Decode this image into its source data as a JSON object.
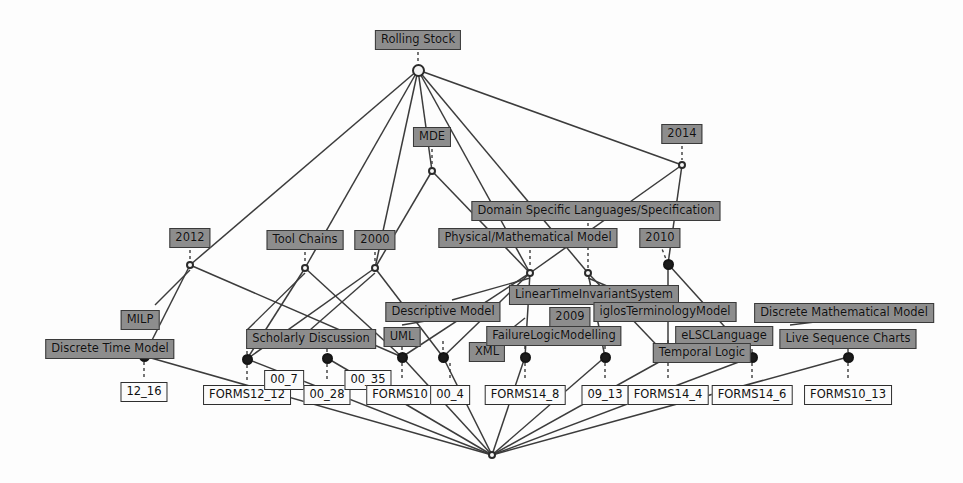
{
  "diagram": {
    "type": "concept-lattice",
    "width": 963,
    "height": 483,
    "colors": {
      "attribute_box_fill": "#8d8d8d",
      "object_box_fill": "#fbfbfb",
      "box_border": "#3a3a3a",
      "edge": "#3c3c3c",
      "node_filled": "#1c1c1c",
      "node_empty": "#f4f4f4",
      "background": "#fdfdfd"
    }
  },
  "nodes": [
    {
      "id": "top",
      "x": 418,
      "y": 70,
      "kind": "empty"
    },
    {
      "id": "n_mde",
      "x": 432,
      "y": 171,
      "kind": "small"
    },
    {
      "id": "n_2014",
      "x": 682,
      "y": 165,
      "kind": "small"
    },
    {
      "id": "n_2012",
      "x": 190,
      "y": 265,
      "kind": "small"
    },
    {
      "id": "n_tool",
      "x": 305,
      "y": 268,
      "kind": "small"
    },
    {
      "id": "n_2000",
      "x": 375,
      "y": 268,
      "kind": "small"
    },
    {
      "id": "n_lti1",
      "x": 530,
      "y": 273,
      "kind": "small"
    },
    {
      "id": "n_lti2",
      "x": 588,
      "y": 273,
      "kind": "small"
    },
    {
      "id": "n_f101",
      "x": 668,
      "y": 264,
      "kind": "filled"
    },
    {
      "id": "n_b1",
      "x": 144,
      "y": 356,
      "kind": "filled"
    },
    {
      "id": "n_b2",
      "x": 247,
      "y": 359,
      "kind": "filled"
    },
    {
      "id": "n_b3",
      "x": 327,
      "y": 358,
      "kind": "filled"
    },
    {
      "id": "n_b4",
      "x": 402,
      "y": 357,
      "kind": "filled"
    },
    {
      "id": "n_b5",
      "x": 443,
      "y": 357,
      "kind": "filled"
    },
    {
      "id": "n_b6",
      "x": 525,
      "y": 357,
      "kind": "filled"
    },
    {
      "id": "n_b7",
      "x": 605,
      "y": 357,
      "kind": "filled"
    },
    {
      "id": "n_b8",
      "x": 668,
      "y": 357,
      "kind": "filled"
    },
    {
      "id": "n_b9",
      "x": 752,
      "y": 357,
      "kind": "filled"
    },
    {
      "id": "n_b10",
      "x": 848,
      "y": 357,
      "kind": "filled"
    },
    {
      "id": "bottom",
      "x": 492,
      "y": 455,
      "kind": "small"
    }
  ],
  "edges": [
    [
      "top",
      "n_mde"
    ],
    [
      "top",
      "n_2012"
    ],
    [
      "top",
      "n_tool"
    ],
    [
      "top",
      "n_2000"
    ],
    [
      "top",
      "n_lti1"
    ],
    [
      "top",
      "n_2014"
    ],
    [
      "top",
      "n_lti2"
    ],
    [
      "n_mde",
      "n_2000"
    ],
    [
      "n_mde",
      "n_lti1"
    ],
    [
      "n_2014",
      "n_lti1"
    ],
    [
      "n_2014",
      "n_f101"
    ],
    [
      "n_2012",
      "n_b1"
    ],
    [
      "n_2012",
      "n_b4"
    ],
    [
      "n_tool",
      "n_b2"
    ],
    [
      "n_tool",
      "n_b4"
    ],
    [
      "n_2000",
      "n_b2"
    ],
    [
      "n_2000",
      "n_b5"
    ],
    [
      "n_lti1",
      "n_b4"
    ],
    [
      "n_lti1",
      "n_b5"
    ],
    [
      "n_lti1",
      "n_b6"
    ],
    [
      "n_lti2",
      "n_b7"
    ],
    [
      "n_lti2",
      "n_b8"
    ],
    [
      "n_f101",
      "n_b8"
    ],
    [
      "n_f101",
      "n_b9"
    ],
    [
      "n_b1",
      "bottom"
    ],
    [
      "n_b2",
      "bottom"
    ],
    [
      "n_b3",
      "bottom"
    ],
    [
      "n_b4",
      "bottom"
    ],
    [
      "n_b5",
      "bottom"
    ],
    [
      "n_b6",
      "bottom"
    ],
    [
      "n_b7",
      "bottom"
    ],
    [
      "n_b8",
      "bottom"
    ],
    [
      "n_b9",
      "bottom"
    ],
    [
      "n_b10",
      "bottom"
    ]
  ],
  "attribute_labels": [
    {
      "name": "rolling-stock",
      "text": "Rolling Stock",
      "x": 418,
      "y": 30,
      "node": "top"
    },
    {
      "name": "mde",
      "text": "MDE",
      "x": 432,
      "y": 127,
      "node": "n_mde"
    },
    {
      "name": "year-2014",
      "text": "2014",
      "x": 682,
      "y": 124,
      "node": "n_2014"
    },
    {
      "name": "dsl-spec",
      "text": "Domain Specific Languages/Specification",
      "x": 596,
      "y": 201,
      "node": "n_lti1"
    },
    {
      "name": "year-2012",
      "text": "2012",
      "x": 190,
      "y": 228,
      "node": "n_2012"
    },
    {
      "name": "tool-chains",
      "text": "Tool Chains",
      "x": 305,
      "y": 230,
      "node": "n_tool"
    },
    {
      "name": "year-2000",
      "text": "2000",
      "x": 375,
      "y": 230,
      "node": "n_2000"
    },
    {
      "name": "phys-math-model",
      "text": "Physical/Mathematical Model",
      "x": 528,
      "y": 228,
      "node": "n_lti1"
    },
    {
      "name": "year-2010",
      "text": "2010",
      "x": 660,
      "y": 228,
      "node": "n_f101"
    },
    {
      "name": "lti-system",
      "text": "LinearTimeInvariantSystem",
      "x": 594,
      "y": 285,
      "node": "n_lti2"
    },
    {
      "name": "year-2009",
      "text": "2009",
      "x": 570,
      "y": 307,
      "node": "n_lti2"
    },
    {
      "name": "iglos-term",
      "text": "iglosTerminologyModel",
      "x": 665,
      "y": 302,
      "node": "n_b8"
    },
    {
      "name": "milp",
      "text": "MILP",
      "x": 140,
      "y": 310,
      "node": "n_b1"
    },
    {
      "name": "discrete-time",
      "text": "Discrete Time Model",
      "x": 110,
      "y": 339,
      "node": "n_b1"
    },
    {
      "name": "scholarly",
      "text": "Scholarly Discussion",
      "x": 311,
      "y": 329,
      "node": "n_b3"
    },
    {
      "name": "descriptive",
      "text": "Descriptive Model",
      "x": 443,
      "y": 302,
      "node": "n_b5"
    },
    {
      "name": "uml",
      "text": "UML",
      "x": 402,
      "y": 327,
      "node": "n_b4"
    },
    {
      "name": "xml",
      "text": "XML",
      "x": 487,
      "y": 342,
      "node": "n_b5"
    },
    {
      "name": "failure-logic",
      "text": "FailureLogicModelling",
      "x": 554,
      "y": 326,
      "node": "n_b6"
    },
    {
      "name": "acsl-frama-c",
      "text": "ACSL(Frama-C)",
      "x": 845,
      "y": 303,
      "node": "n_b10"
    },
    {
      "name": "discrete-math",
      "text": "Discrete Mathematical Model",
      "x": 844,
      "y": 303,
      "node": "n_b10"
    },
    {
      "name": "elsc-language",
      "text": "eLSCLanguage",
      "x": 724,
      "y": 326,
      "node": "n_b9"
    },
    {
      "name": "temporal-logic",
      "text": "Temporal Logic",
      "x": 702,
      "y": 343,
      "node": "n_b8"
    },
    {
      "name": "live-seq-charts",
      "text": "Live Sequence Charts",
      "x": 848,
      "y": 329,
      "node": "n_b10"
    }
  ],
  "object_labels": [
    {
      "name": "obj-12-16",
      "text": "12_16",
      "x": 144,
      "y": 382,
      "node": "n_b1"
    },
    {
      "name": "obj-forms12-12",
      "text": "FORMS12_12",
      "x": 247,
      "y": 385,
      "node": "n_b2"
    },
    {
      "name": "obj-00-7",
      "text": "00_7",
      "x": 284,
      "y": 370,
      "node": "n_b2"
    },
    {
      "name": "obj-00-28",
      "text": "00_28",
      "x": 327,
      "y": 385,
      "node": "n_b3"
    },
    {
      "name": "obj-00-35",
      "text": "00_35",
      "x": 368,
      "y": 370,
      "node": "n_b3"
    },
    {
      "name": "obj-forms10",
      "text": "FORMS10",
      "x": 400,
      "y": 385,
      "node": "n_b4"
    },
    {
      "name": "obj-00-4",
      "text": "00_4",
      "x": 450,
      "y": 385,
      "node": "n_b5"
    },
    {
      "name": "obj-forms14-8",
      "text": "FORMS14_8",
      "x": 525,
      "y": 385,
      "node": "n_b6"
    },
    {
      "name": "obj-09-13",
      "text": "09_13",
      "x": 605,
      "y": 385,
      "node": "n_b7"
    },
    {
      "name": "obj-forms14-4",
      "text": "FORMS14_4",
      "x": 668,
      "y": 385,
      "node": "n_b8"
    },
    {
      "name": "obj-forms14-6",
      "text": "FORMS14_6",
      "x": 752,
      "y": 385,
      "node": "n_b9"
    },
    {
      "name": "obj-forms10-13",
      "text": "FORMS10_13",
      "x": 848,
      "y": 385,
      "node": "n_b10"
    }
  ],
  "label_connectors": [
    {
      "from_x": 418,
      "from_y": 46,
      "to_x": 418,
      "to_y": 64
    },
    {
      "from_x": 432,
      "from_y": 143,
      "to_x": 432,
      "to_y": 166
    },
    {
      "from_x": 682,
      "from_y": 140,
      "to_x": 682,
      "to_y": 160
    },
    {
      "from_x": 190,
      "from_y": 244,
      "to_x": 190,
      "to_y": 260
    },
    {
      "from_x": 305,
      "from_y": 246,
      "to_x": 305,
      "to_y": 263
    },
    {
      "from_x": 375,
      "from_y": 246,
      "to_x": 375,
      "to_y": 263
    },
    {
      "from_x": 530,
      "from_y": 244,
      "to_x": 530,
      "to_y": 268
    },
    {
      "from_x": 588,
      "from_y": 217,
      "to_x": 588,
      "to_y": 268
    },
    {
      "from_x": 660,
      "from_y": 244,
      "to_x": 666,
      "to_y": 259
    },
    {
      "from_x": 144,
      "from_y": 352,
      "to_x": 144,
      "to_y": 352
    },
    {
      "from_x": 144,
      "from_y": 362,
      "to_x": 144,
      "to_y": 377
    },
    {
      "from_x": 247,
      "from_y": 345,
      "to_x": 247,
      "to_y": 354
    },
    {
      "from_x": 247,
      "from_y": 365,
      "to_x": 247,
      "to_y": 380
    },
    {
      "from_x": 327,
      "from_y": 343,
      "to_x": 327,
      "to_y": 353
    },
    {
      "from_x": 327,
      "from_y": 364,
      "to_x": 327,
      "to_y": 380
    },
    {
      "from_x": 402,
      "from_y": 341,
      "to_x": 402,
      "to_y": 352
    },
    {
      "from_x": 402,
      "from_y": 363,
      "to_x": 402,
      "to_y": 380
    },
    {
      "from_x": 443,
      "from_y": 341,
      "to_x": 443,
      "to_y": 352
    },
    {
      "from_x": 450,
      "from_y": 363,
      "to_x": 450,
      "to_y": 380
    },
    {
      "from_x": 525,
      "from_y": 340,
      "to_x": 525,
      "to_y": 352
    },
    {
      "from_x": 525,
      "from_y": 363,
      "to_x": 525,
      "to_y": 380
    },
    {
      "from_x": 605,
      "from_y": 340,
      "to_x": 605,
      "to_y": 352
    },
    {
      "from_x": 605,
      "from_y": 363,
      "to_x": 605,
      "to_y": 380
    },
    {
      "from_x": 668,
      "from_y": 340,
      "to_x": 668,
      "to_y": 352
    },
    {
      "from_x": 668,
      "from_y": 363,
      "to_x": 668,
      "to_y": 380
    },
    {
      "from_x": 752,
      "from_y": 343,
      "to_x": 752,
      "to_y": 352
    },
    {
      "from_x": 752,
      "from_y": 363,
      "to_x": 752,
      "to_y": 380
    },
    {
      "from_x": 848,
      "from_y": 343,
      "to_x": 848,
      "to_y": 352
    },
    {
      "from_x": 848,
      "from_y": 363,
      "to_x": 848,
      "to_y": 380
    }
  ],
  "extra_edges": [
    {
      "x1": 305,
      "y1": 273,
      "x2": 247,
      "y2": 330
    },
    {
      "x1": 375,
      "y1": 273,
      "x2": 310,
      "y2": 330
    },
    {
      "x1": 190,
      "y1": 270,
      "x2": 155,
      "y2": 305
    },
    {
      "x1": 530,
      "y1": 278,
      "x2": 452,
      "y2": 300
    },
    {
      "x1": 588,
      "y1": 278,
      "x2": 640,
      "y2": 300
    },
    {
      "x1": 443,
      "y1": 318,
      "x2": 402,
      "y2": 325
    },
    {
      "x1": 525,
      "y1": 318,
      "x2": 500,
      "y2": 338
    },
    {
      "x1": 848,
      "y1": 318,
      "x2": 790,
      "y2": 325
    }
  ]
}
